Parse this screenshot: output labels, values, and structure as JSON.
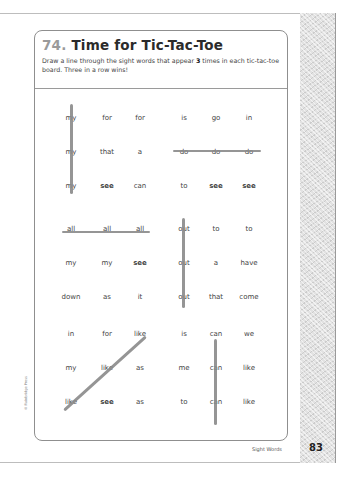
{
  "header": {
    "number": "74.",
    "title": "Time for Tic-Tac-Toe",
    "instruction_pre": "Draw a line through the sight words that appear ",
    "instruction_bold": "3",
    "instruction_post": " times in each tic-tac-toe board. Three in a row wins!"
  },
  "boards": [
    {
      "rows": [
        [
          "my",
          "for",
          "for"
        ],
        [
          "my",
          "that",
          "a"
        ],
        [
          "my",
          "see",
          "can"
        ]
      ],
      "win": "column-1"
    },
    {
      "rows": [
        [
          "is",
          "go",
          "in"
        ],
        [
          "do",
          "do",
          "do"
        ],
        [
          "to",
          "see",
          "see"
        ]
      ],
      "win": "row-2"
    },
    {
      "rows": [
        [
          "all",
          "all",
          "all"
        ],
        [
          "my",
          "my",
          "see"
        ],
        [
          "down",
          "as",
          "it"
        ]
      ],
      "win": "row-1"
    },
    {
      "rows": [
        [
          "out",
          "to",
          "to"
        ],
        [
          "out",
          "a",
          "have"
        ],
        [
          "out",
          "that",
          "come"
        ]
      ],
      "win": "column-1"
    },
    {
      "rows": [
        [
          "in",
          "for",
          "like"
        ],
        [
          "my",
          "like",
          "as"
        ],
        [
          "like",
          "see",
          "as"
        ]
      ],
      "win": "diagonal-up"
    },
    {
      "rows": [
        [
          "is",
          "can",
          "we"
        ],
        [
          "me",
          "can",
          "like"
        ],
        [
          "to",
          "can",
          "like"
        ]
      ],
      "win": "column-2"
    }
  ],
  "footer": {
    "section": "Sight Words",
    "page_number": "83",
    "copyright": "© Rainbridge Press"
  }
}
